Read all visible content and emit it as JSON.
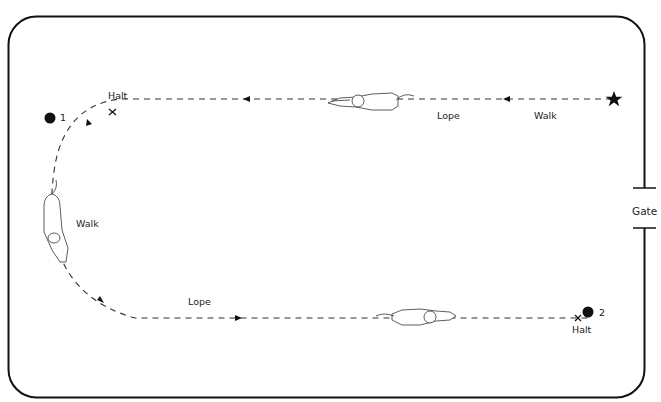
{
  "diagram": {
    "type": "horse reining pattern",
    "arena": {
      "shape": "rounded-rectangle",
      "border_color": "#111111"
    },
    "gate": {
      "label": "Gate",
      "side": "right"
    },
    "markers": [
      {
        "id": "start",
        "symbol": "star",
        "label": ""
      },
      {
        "id": "marker-1",
        "symbol": "dot",
        "label": "1"
      },
      {
        "id": "marker-2",
        "symbol": "dot",
        "label": "2"
      }
    ],
    "labels": {
      "top_walk": "Walk",
      "top_lope": "Lope",
      "top_halt": "Halt",
      "left_walk": "Walk",
      "bottom_lope": "Lope",
      "bottom_halt": "Halt"
    },
    "path": {
      "style": "dashed",
      "color": "#333333",
      "segments": [
        "Start at star, walk left",
        "Lope left along top",
        "Halt at X near marker 1",
        "Walk around left turn",
        "Lope right along bottom",
        "Halt at X at marker 2"
      ]
    },
    "horses": [
      {
        "position": "top",
        "facing": "left"
      },
      {
        "position": "left",
        "facing": "down"
      },
      {
        "position": "bottom",
        "facing": "right"
      }
    ]
  }
}
